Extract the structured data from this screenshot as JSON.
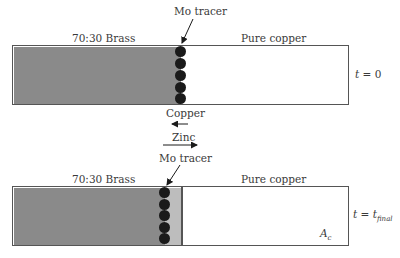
{
  "diagram": {
    "top": {
      "left_label": "70:30 Brass",
      "right_label": "Pure copper",
      "marker_label": "Mo tracer",
      "time_label_var": "t",
      "time_label_eq": " = 0",
      "markers": 5
    },
    "middle": {
      "copper_label": "Copper",
      "copper_direction": "left",
      "zinc_label": "Zinc",
      "zinc_direction": "right"
    },
    "bottom": {
      "left_label": "70:30 Brass",
      "right_label": "Pure copper",
      "marker_label": "Mo tracer",
      "time_label_var": "t",
      "time_label_eq": " = ",
      "time_label_sub_var": "t",
      "time_label_sub": "final",
      "area_label": "A",
      "area_sub": "c",
      "markers": 5
    },
    "colors": {
      "brass": "#8a8a8a",
      "diffusion_zone": "#bdbdbd",
      "copper": "#ffffff",
      "marker": "#1a1a1a",
      "border": "#555555"
    }
  }
}
